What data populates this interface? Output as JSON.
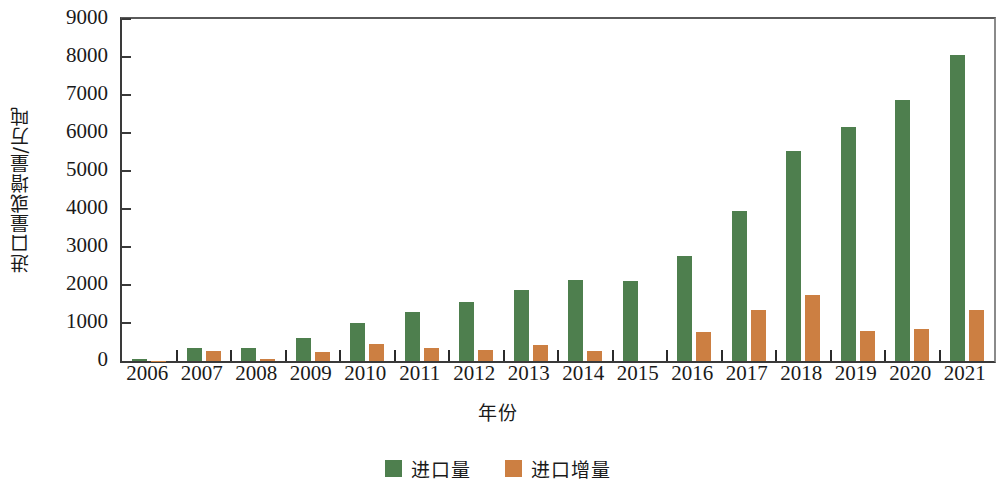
{
  "chart_data": {
    "type": "bar",
    "title": "",
    "xlabel": "年份",
    "ylabel": "进口量或增量/万吨",
    "ylim": [
      0,
      9000
    ],
    "ytick_step": 1000,
    "yticks": [
      "0",
      "1000",
      "2000",
      "3000",
      "4000",
      "5000",
      "6000",
      "7000",
      "8000",
      "9000"
    ],
    "grid": false,
    "legend_position": "bottom-center",
    "categories": [
      "2006",
      "2007",
      "2008",
      "2009",
      "2010",
      "2011",
      "2012",
      "2013",
      "2014",
      "2015",
      "2016",
      "2017",
      "2018",
      "2019",
      "2020",
      "2021"
    ],
    "series": [
      {
        "name": "进口量",
        "color": "#4e7f4e",
        "values": [
          60,
          330,
          340,
          610,
          1000,
          1300,
          1560,
          1880,
          2120,
          2110,
          2760,
          3960,
          5520,
          6150,
          6880,
          8050
        ]
      },
      {
        "name": "进口增量",
        "color": "#cc7f42",
        "values": [
          10,
          270,
          40,
          250,
          440,
          350,
          300,
          420,
          260,
          0,
          760,
          1330,
          1730,
          800,
          840,
          1350
        ]
      }
    ]
  },
  "legend": {
    "items": [
      {
        "label": "进口量",
        "color": "#4e7f4e"
      },
      {
        "label": "进口增量",
        "color": "#cc7f42"
      }
    ]
  },
  "axes": {
    "y_title": "进口量或增量/万吨",
    "x_title": "年份"
  }
}
